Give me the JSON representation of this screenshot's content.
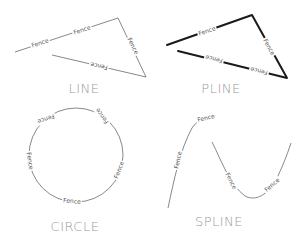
{
  "diagram": {
    "background": "#ffffff",
    "line_label": "Fence",
    "panels": [
      {
        "id": "line",
        "title": "LINE",
        "stroke": "#6a6a6a"
      },
      {
        "id": "pline",
        "title": "PLINE",
        "stroke": "#1a1a1a"
      },
      {
        "id": "circle",
        "title": "CIRCLE",
        "stroke": "#6a6a6a"
      },
      {
        "id": "spline",
        "title": "SPLINE",
        "stroke": "#6a6a6a"
      }
    ]
  }
}
